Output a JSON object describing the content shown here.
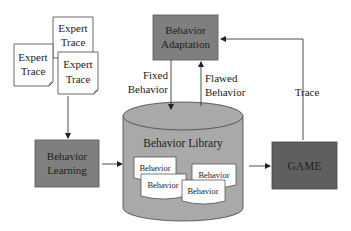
{
  "diagram": {
    "expert_traces": [
      {
        "line1": "Expert",
        "line2": "Trace"
      },
      {
        "line1": "Expert",
        "line2": "Trace"
      },
      {
        "line1": "Expert",
        "line2": "Trace"
      }
    ],
    "behavior_adaptation": {
      "line1": "Behavior",
      "line2": "Adaptation"
    },
    "behavior_learning": {
      "line1": "Behavior",
      "line2": "Learning"
    },
    "behavior_library": {
      "title": "Behavior Library",
      "behaviors": [
        "Behavior",
        "Behavior",
        "Behavior",
        "Behavior"
      ]
    },
    "game": {
      "label": "GAME"
    },
    "edges": {
      "fixed": {
        "line1": "Fixed",
        "line2": "Behavior"
      },
      "flawed": {
        "line1": "Flawed",
        "line2": "Behavior"
      },
      "trace": {
        "label": "Trace"
      }
    },
    "colors": {
      "box_fill": "#7f7f7f",
      "game_fill": "#5f5f5f",
      "cylinder_fill": "#a9a9a9",
      "document_fill": "#ffffff",
      "line": "#222222"
    }
  }
}
